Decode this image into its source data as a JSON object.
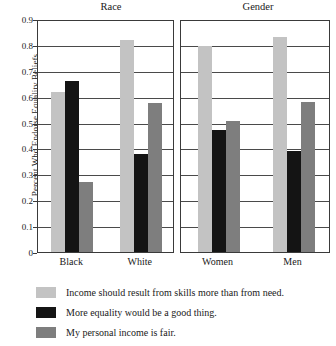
{
  "chart_data": {
    "type": "bar",
    "title": "",
    "xlabel": "",
    "ylabel": "Percent Who Endorse Equality Beliefs",
    "ylim": [
      0,
      0.9
    ],
    "ytick_labels": [
      "0.9",
      "0.8",
      "0.7",
      "0.6",
      "0.5",
      "0.4",
      "0.3",
      "0.2",
      "0.1",
      "0"
    ],
    "ytick_values": [
      0.9,
      0.8,
      0.7,
      0.6,
      0.5,
      0.4,
      0.3,
      0.2,
      0.1,
      0
    ],
    "grid": true,
    "legend_position": "bottom-left",
    "panels": [
      {
        "title": "Race",
        "categories": [
          "Black",
          "White"
        ]
      },
      {
        "title": "Gender",
        "categories": [
          "Women",
          "Men"
        ]
      }
    ],
    "categories": [
      "Black",
      "White",
      "Women",
      "Men"
    ],
    "series": [
      {
        "name": "Income should result from skills more than from need.",
        "color": "#c3c3c3",
        "values": [
          0.62,
          0.82,
          0.795,
          0.83
        ]
      },
      {
        "name": "More equality would be a good thing.",
        "color": "#141414",
        "values": [
          0.66,
          0.38,
          0.47,
          0.39
        ]
      },
      {
        "name": "My personal income is fair.",
        "color": "#7e7e7e",
        "values": [
          0.27,
          0.575,
          0.505,
          0.578
        ]
      }
    ]
  }
}
